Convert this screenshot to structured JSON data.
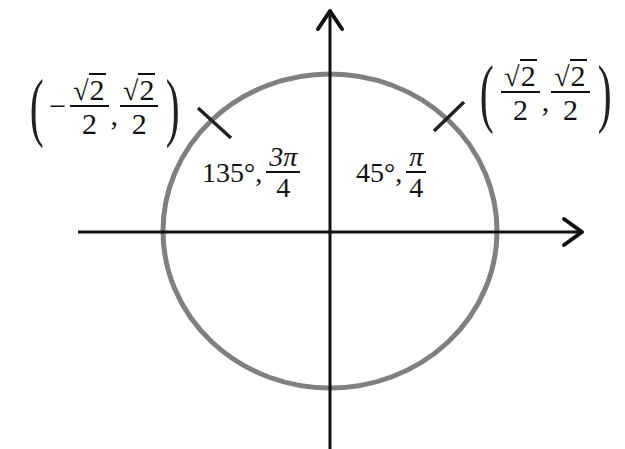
{
  "diagram": {
    "colors": {
      "axis": "#111111",
      "circle": "#808080",
      "text": "#111111",
      "background": "#ffffff"
    },
    "axes": {
      "x_axis": {
        "arrow": "right"
      },
      "y_axis": {
        "arrow": "up"
      }
    },
    "points": [
      {
        "id": "q2",
        "angle_deg": "135°",
        "angle_rad_num": "3π",
        "angle_rad_den": "4",
        "coord_x_sign": "−",
        "coord_x_num_root": "2",
        "coord_x_den": "2",
        "coord_y_num_root": "2",
        "coord_y_den": "2",
        "separator": ","
      },
      {
        "id": "q1",
        "angle_deg": "45°",
        "angle_rad_num": "π",
        "angle_rad_den": "4",
        "coord_x_sign": "",
        "coord_x_num_root": "2",
        "coord_x_den": "2",
        "coord_y_num_root": "2",
        "coord_y_den": "2",
        "separator": ","
      }
    ],
    "symbols": {
      "sqrt": "√",
      "open_paren": "(",
      "close_paren": ")",
      "comma": ","
    }
  }
}
